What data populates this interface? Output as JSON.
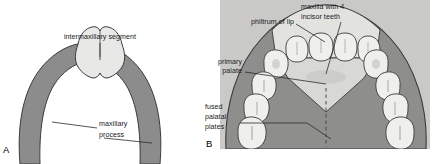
{
  "figure": {
    "width": 434,
    "height": 164,
    "background": "#ffffff"
  },
  "colors": {
    "maxillary_process_fill": "#8c8c8c",
    "intermaxillary_segment_fill": "#e8e8e6",
    "panel_b_background": "#c9c9c7",
    "palatal_plate_fill": "#8e8e8c",
    "philtrum_fill": "#e2e2df",
    "primary_palate_fill": "#d8d8d5",
    "tooth_fill": "#efefed",
    "outline": "#3a3a3a",
    "leader_line": "#2b2b2b",
    "text": "#1a1a1a"
  },
  "panels": [
    {
      "id": "A",
      "letter": "A",
      "labels": [
        {
          "name": "intermaxillary-segment",
          "text": "intermaxillary segment"
        },
        {
          "name": "maxillary-process-line1",
          "text": "maxillary"
        },
        {
          "name": "maxillary-process-line2",
          "text": "process"
        }
      ]
    },
    {
      "id": "B",
      "letter": "B",
      "labels": [
        {
          "name": "maxilla-with-4-incisor-teeth-line1",
          "text": "maxilla with 4"
        },
        {
          "name": "maxilla-with-4-incisor-teeth-line2",
          "text": "incisor teeth"
        },
        {
          "name": "philtrum-of-lip",
          "text": "philtrum of lip"
        },
        {
          "name": "primary-palate-line1",
          "text": "primary"
        },
        {
          "name": "primary-palate-line2",
          "text": "palate"
        },
        {
          "name": "fused-palatal-plates-line1",
          "text": "fused"
        },
        {
          "name": "fused-palatal-plates-line2",
          "text": "palatal"
        },
        {
          "name": "fused-palatal-plates-line3",
          "text": "plates"
        }
      ],
      "counts": {
        "incisor_teeth": 4,
        "left_posterior_teeth": 4,
        "right_posterior_teeth": 4
      }
    }
  ]
}
